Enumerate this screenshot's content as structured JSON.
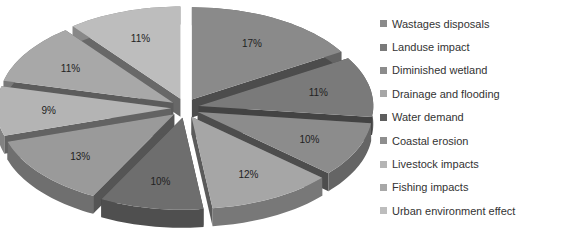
{
  "chart_data": {
    "type": "pie",
    "style": "3d-exploded",
    "title": "",
    "categories": [
      "Wastages disposals",
      "Landuse impact",
      "Diminished wetland",
      "Drainage and flooding",
      "Water demand",
      "Coastal erosion",
      "Livestock impacts",
      "Fishing impacts",
      "Urban environment effect"
    ],
    "values": [
      17,
      11,
      10,
      12,
      10,
      13,
      9,
      11,
      11
    ],
    "labels": [
      "17%",
      "11%",
      "10%",
      "12%",
      "10%",
      "13%",
      "9%",
      "11%",
      "11%"
    ],
    "colors": [
      "#8a8a8a",
      "#7a7a7a",
      "#8c8c8c",
      "#a6a6a6",
      "#6e6e6e",
      "#9a9a9a",
      "#b4b4b4",
      "#a8a8a8",
      "#bdbdbd"
    ],
    "legend_position": "right"
  },
  "legend": {
    "items": [
      {
        "label": "Wastages disposals",
        "color": "#8a8a8a"
      },
      {
        "label": "Landuse impact",
        "color": "#7a7a7a"
      },
      {
        "label": "Diminished wetland",
        "color": "#8c8c8c"
      },
      {
        "label": "Drainage and flooding",
        "color": "#a6a6a6"
      },
      {
        "label": "Water demand",
        "color": "#5e5e5e"
      },
      {
        "label": "Coastal erosion",
        "color": "#8e8e8e"
      },
      {
        "label": "Livestock impacts",
        "color": "#b4b4b4"
      },
      {
        "label": "Fishing impacts",
        "color": "#a8a8a8"
      },
      {
        "label": "Urban environment effect",
        "color": "#bdbdbd"
      }
    ]
  }
}
